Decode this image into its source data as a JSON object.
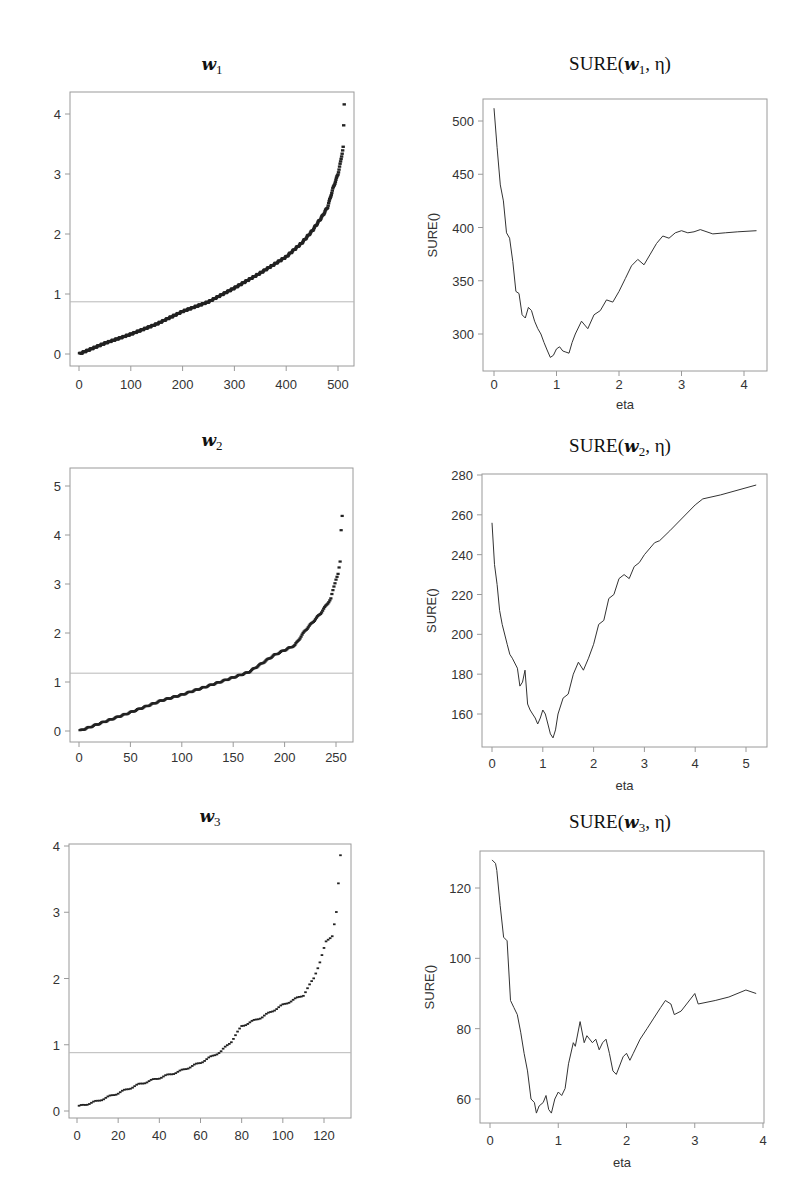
{
  "chart_data": [
    {
      "id": "w1",
      "type": "scatter",
      "title": "w1",
      "title_main": "w",
      "title_sub": "1",
      "xlabel": "",
      "ylabel": "",
      "xlim": [
        -10,
        540
      ],
      "ylim": [
        -0.2,
        4.3
      ],
      "xticks": [
        0,
        100,
        200,
        300,
        400,
        500
      ],
      "yticks": [
        0,
        1,
        2,
        3,
        4
      ],
      "n_points": 512,
      "threshold_hline": 0.87,
      "grid": false,
      "description": "Sorted absolute coefficients of w1 (index vs value), rising smoothly from 0 to ~2.3 at index 480, then steeply to ~3.5; maximum ~4.15 at index 512",
      "anchor_points": [
        [
          0,
          0
        ],
        [
          50,
          0.18
        ],
        [
          100,
          0.33
        ],
        [
          150,
          0.5
        ],
        [
          200,
          0.71
        ],
        [
          250,
          0.87
        ],
        [
          300,
          1.1
        ],
        [
          350,
          1.35
        ],
        [
          400,
          1.62
        ],
        [
          430,
          1.85
        ],
        [
          450,
          2.05
        ],
        [
          470,
          2.3
        ],
        [
          480,
          2.45
        ],
        [
          490,
          2.75
        ],
        [
          500,
          3.0
        ],
        [
          505,
          3.2
        ],
        [
          510,
          3.45
        ],
        [
          512,
          4.15
        ]
      ]
    },
    {
      "id": "sure_w1",
      "type": "line",
      "title": "SURE(w1, η)",
      "xlabel": "eta",
      "ylabel": "SURE()",
      "xlim": [
        -0.1,
        4.35
      ],
      "ylim": [
        270,
        520
      ],
      "xticks": [
        0,
        1,
        2,
        3,
        4
      ],
      "yticks": [
        300,
        350,
        400,
        450,
        500
      ],
      "grid": false,
      "x": [
        0.0,
        0.05,
        0.1,
        0.15,
        0.2,
        0.25,
        0.3,
        0.35,
        0.4,
        0.45,
        0.5,
        0.55,
        0.6,
        0.65,
        0.7,
        0.75,
        0.8,
        0.85,
        0.9,
        0.95,
        1.0,
        1.05,
        1.1,
        1.15,
        1.2,
        1.25,
        1.3,
        1.4,
        1.5,
        1.6,
        1.7,
        1.8,
        1.9,
        2.0,
        2.1,
        2.2,
        2.3,
        2.4,
        2.5,
        2.6,
        2.7,
        2.8,
        2.9,
        3.0,
        3.1,
        3.2,
        3.3,
        3.5,
        3.7,
        3.9,
        4.2
      ],
      "y": [
        512,
        475,
        440,
        425,
        395,
        390,
        368,
        340,
        338,
        318,
        315,
        325,
        322,
        312,
        305,
        300,
        292,
        285,
        278,
        280,
        286,
        288,
        284,
        283,
        282,
        292,
        300,
        312,
        305,
        318,
        322,
        332,
        330,
        340,
        352,
        364,
        370,
        365,
        375,
        385,
        392,
        390,
        395,
        397,
        395,
        396,
        398,
        394,
        395,
        396,
        397
      ]
    },
    {
      "id": "w2",
      "type": "scatter",
      "title": "w2",
      "title_main": "w",
      "title_sub": "2",
      "xlabel": "",
      "ylabel": "",
      "xlim": [
        -8,
        268
      ],
      "ylim": [
        -0.2,
        5.4
      ],
      "xticks": [
        0,
        50,
        100,
        150,
        200,
        250
      ],
      "yticks": [
        0,
        1,
        2,
        3,
        4,
        5
      ],
      "n_points": 256,
      "threshold_hline": 1.18,
      "grid": false,
      "description": "Sorted absolute coefficients of w2, near-linear to ~1.2 at index 165, then steeper to ~2.7 at 245; tail points 3.1, 3.2, 3.45, 4.1, 4.4, 5.1",
      "anchor_points": [
        [
          0,
          0
        ],
        [
          50,
          0.38
        ],
        [
          80,
          0.62
        ],
        [
          100,
          0.74
        ],
        [
          130,
          0.95
        ],
        [
          165,
          1.2
        ],
        [
          190,
          1.55
        ],
        [
          210,
          1.75
        ],
        [
          220,
          2.05
        ],
        [
          235,
          2.4
        ],
        [
          245,
          2.7
        ],
        [
          248,
          2.95
        ],
        [
          250,
          3.1
        ],
        [
          252,
          3.2
        ],
        [
          254,
          3.45
        ],
        [
          255,
          4.1
        ],
        [
          256,
          4.4
        ],
        [
          257,
          5.1
        ]
      ]
    },
    {
      "id": "sure_w2",
      "type": "line",
      "title": "SURE(w2, η)",
      "xlabel": "eta",
      "ylabel": "SURE()",
      "xlim": [
        -0.2,
        5.4
      ],
      "ylim": [
        144,
        282
      ],
      "xticks": [
        0,
        1,
        2,
        3,
        4,
        5
      ],
      "yticks": [
        160,
        180,
        200,
        220,
        240,
        260,
        280
      ],
      "grid": false,
      "x": [
        0.0,
        0.05,
        0.1,
        0.15,
        0.2,
        0.3,
        0.35,
        0.4,
        0.5,
        0.55,
        0.6,
        0.65,
        0.7,
        0.75,
        0.8,
        0.85,
        0.9,
        0.95,
        1.0,
        1.05,
        1.1,
        1.15,
        1.2,
        1.25,
        1.3,
        1.4,
        1.5,
        1.6,
        1.7,
        1.8,
        1.9,
        2.0,
        2.1,
        2.2,
        2.3,
        2.4,
        2.5,
        2.6,
        2.7,
        2.8,
        2.9,
        3.0,
        3.2,
        3.3,
        3.5,
        4.0,
        4.15,
        4.5,
        5.2
      ],
      "y": [
        256,
        235,
        225,
        212,
        205,
        195,
        190,
        188,
        183,
        174,
        176,
        182,
        165,
        162,
        160,
        158,
        155,
        158,
        162,
        160,
        155,
        150,
        148,
        152,
        160,
        168,
        170,
        180,
        186,
        182,
        188,
        195,
        205,
        207,
        218,
        220,
        228,
        230,
        228,
        234,
        236,
        240,
        246,
        247,
        252,
        265,
        268,
        270,
        275
      ]
    },
    {
      "id": "w3",
      "type": "scatter",
      "title": "w3",
      "title_main": "w",
      "title_sub": "3",
      "xlabel": "",
      "ylabel": "",
      "xlim": [
        -4,
        134
      ],
      "ylim": [
        -0.1,
        4.0
      ],
      "xticks": [
        0,
        20,
        40,
        60,
        80,
        100,
        120
      ],
      "yticks": [
        0,
        1,
        2,
        3,
        4
      ],
      "n_points": 128,
      "threshold_hline": 0.88,
      "grid": false,
      "description": "Sorted absolute coefficients of w3 with step-like pattern; ~0.07 at index 1 rising to ~1.75 at 112, then jumps to 2.0, 2.25, 2.55, 2.65, 3.0; max ~3.85 at 128",
      "anchor_points": [
        [
          1,
          0.07
        ],
        [
          10,
          0.15
        ],
        [
          20,
          0.27
        ],
        [
          30,
          0.4
        ],
        [
          40,
          0.5
        ],
        [
          50,
          0.6
        ],
        [
          60,
          0.73
        ],
        [
          70,
          0.9
        ],
        [
          75,
          1.05
        ],
        [
          80,
          1.28
        ],
        [
          90,
          1.42
        ],
        [
          100,
          1.6
        ],
        [
          110,
          1.75
        ],
        [
          115,
          2.0
        ],
        [
          118,
          2.25
        ],
        [
          121,
          2.55
        ],
        [
          124,
          2.65
        ],
        [
          126,
          3.0
        ],
        [
          128,
          3.85
        ]
      ]
    },
    {
      "id": "sure_w3",
      "type": "line",
      "title": "SURE(w3, η)",
      "xlabel": "eta",
      "ylabel": "SURE()",
      "xlim": [
        -0.1,
        4.05
      ],
      "ylim": [
        53,
        130
      ],
      "xticks": [
        0,
        1,
        2,
        3,
        4
      ],
      "yticks": [
        60,
        80,
        100,
        120
      ],
      "grid": false,
      "x": [
        0.03,
        0.08,
        0.1,
        0.15,
        0.2,
        0.25,
        0.3,
        0.35,
        0.4,
        0.45,
        0.5,
        0.55,
        0.6,
        0.65,
        0.68,
        0.72,
        0.78,
        0.82,
        0.86,
        0.9,
        0.95,
        1.0,
        1.05,
        1.1,
        1.15,
        1.22,
        1.25,
        1.32,
        1.38,
        1.42,
        1.5,
        1.55,
        1.6,
        1.65,
        1.7,
        1.75,
        1.8,
        1.85,
        1.95,
        2.0,
        2.05,
        2.1,
        2.2,
        2.3,
        2.4,
        2.5,
        2.57,
        2.65,
        2.7,
        2.8,
        3.0,
        3.05,
        3.3,
        3.5,
        3.75,
        3.9
      ],
      "y": [
        128,
        127,
        125,
        115,
        106,
        105,
        88,
        86,
        84,
        79,
        73,
        68,
        60,
        59,
        56,
        58,
        59,
        61,
        57,
        56,
        60,
        62,
        61,
        63,
        70,
        76,
        75,
        82,
        76,
        78,
        76,
        77,
        74,
        76,
        77,
        73,
        68,
        67,
        72,
        73,
        71,
        73,
        77,
        80,
        83,
        86,
        88,
        87,
        84,
        85,
        90,
        87,
        88,
        89,
        91,
        90
      ]
    }
  ],
  "figure": {
    "panel_titles": [
      "w1",
      "SURE(w1, η)",
      "w2",
      "SURE(w2, η)",
      "w3",
      "SURE(w3, η)"
    ],
    "title_parts": {
      "sure_prefix": "SURE(",
      "sure_suffix": ", η)",
      "w": "w",
      "sub1": "1",
      "sub2": "2",
      "sub3": "3"
    },
    "xlabel_eta": "eta",
    "ylabel_sure": "SURE()"
  }
}
